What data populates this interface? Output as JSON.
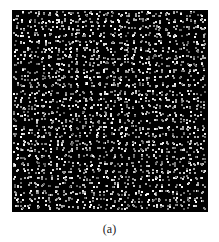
{
  "figure": {
    "caption": "(a)",
    "grid": {
      "rows": 28,
      "cols": 28,
      "background": "#000000",
      "seed": 1337
    }
  }
}
